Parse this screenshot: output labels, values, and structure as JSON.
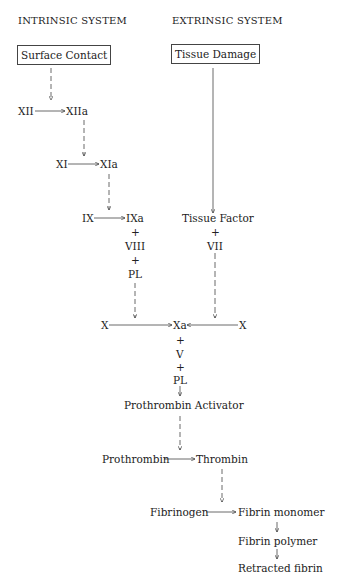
{
  "headers": {
    "intrinsic": "INTRINSIC SYSTEM",
    "extrinsic": "EXTRINSIC SYSTEM"
  },
  "boxes": {
    "surface_contact": "Surface Contact",
    "tissue_damage": "Tissue Damage"
  },
  "nodes": {
    "xii": "XII",
    "xiia": "XIIa",
    "xi": "XI",
    "xia": "XIa",
    "ix": "IX",
    "ixa": "IXa",
    "plus": "+",
    "viii": "VIII",
    "pl": "PL",
    "tissue_factor": "Tissue Factor",
    "vii": "VII",
    "x_left": "X",
    "xa": "Xa",
    "x_right": "X",
    "v": "V",
    "prothrombin_activator": "Prothrombin Activator",
    "prothrombin": "Prothrombin",
    "thrombin": "Thrombin",
    "fibrinogen": "Fibrinogen",
    "fibrin_monomer": "Fibrin monomer",
    "fibrin_polymer": "Fibrin polymer",
    "retracted_fibrin": "Retracted fibrin"
  }
}
